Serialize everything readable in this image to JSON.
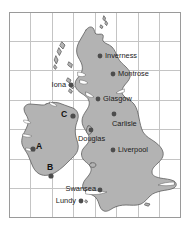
{
  "figure": {
    "type": "map",
    "region": "British Isles and Ireland",
    "background_color": "#ffffff",
    "land_fill_color": "#b3b3b3",
    "land_stroke_color": "#5a5a5a",
    "grid_line_color": "#bfbfbf",
    "border_color": "#9a9a9a",
    "marker_color": "#4d4d4d",
    "label_color": "#1a1a1a"
  },
  "grid": {
    "columns": 8,
    "rows": 7,
    "left": 9,
    "top": 12,
    "right": 181,
    "bottom": 218,
    "visible": true
  },
  "places": [
    {
      "name": "Inverness",
      "dot_x": 100,
      "dot_y": 56,
      "label_x": 105,
      "label_y": 56,
      "anchor": "start"
    },
    {
      "name": "Montrose",
      "dot_x": 113,
      "dot_y": 74,
      "label_x": 118,
      "label_y": 74,
      "anchor": "start"
    },
    {
      "name": "Iona",
      "dot_x": 71,
      "dot_y": 85,
      "label_x": 66,
      "label_y": 85,
      "anchor": "end"
    },
    {
      "name": "Glasgow",
      "dot_x": 98,
      "dot_y": 99,
      "label_x": 103,
      "label_y": 99,
      "anchor": "start"
    },
    {
      "name": "Carlisle",
      "dot_x": 114,
      "dot_y": 114,
      "label_x": 112,
      "label_y": 124,
      "anchor": "start"
    },
    {
      "name": "Douglas",
      "dot_x": 91,
      "dot_y": 130,
      "label_x": 78,
      "label_y": 139,
      "anchor": "start"
    },
    {
      "name": "Liverpool",
      "dot_x": 113,
      "dot_y": 150,
      "label_x": 118,
      "label_y": 150,
      "anchor": "start"
    },
    {
      "name": "Swansea",
      "dot_x": 100,
      "dot_y": 190,
      "label_x": 96,
      "label_y": 189,
      "anchor": "end"
    },
    {
      "name": "Lundy",
      "dot_x": 81,
      "dot_y": 201,
      "label_x": 76,
      "label_y": 201,
      "anchor": "end"
    }
  ],
  "area_markers": [
    {
      "label": "A",
      "label_x": 39,
      "label_y": 147,
      "dot_x": 33,
      "dot_y": 149
    },
    {
      "label": "B",
      "label_x": 50,
      "label_y": 168,
      "dot_x": 51,
      "dot_y": 176
    },
    {
      "label": "C",
      "label_x": 64,
      "label_y": 115,
      "dot_x": 73,
      "dot_y": 116
    }
  ]
}
